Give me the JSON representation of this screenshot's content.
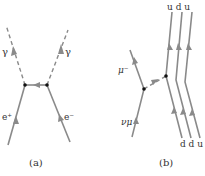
{
  "diagram": {
    "type": "feynman-diagrams",
    "colors": {
      "line": "#8a8a8a",
      "vertex": "#111111",
      "text": "#333333",
      "background": "#ffffff"
    },
    "panel_a": {
      "caption": "(a)",
      "labels": {
        "photon_left": "γ",
        "photon_right": "γ",
        "positron": "e⁺",
        "electron": "e⁻"
      }
    },
    "panel_b": {
      "caption": "(b)",
      "labels": {
        "muon": "μ⁻",
        "neutrino": "νμ",
        "top_quarks": "u d u",
        "bottom_quarks": "d d u"
      },
      "top_quarks": [
        "u",
        "d",
        "u"
      ],
      "bottom_quarks": [
        "d",
        "d",
        "u"
      ]
    }
  }
}
